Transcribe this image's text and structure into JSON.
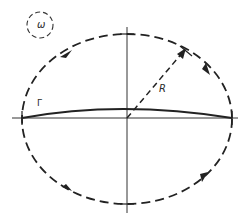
{
  "diagram": {
    "labels": {
      "omega": "ω",
      "radius": "R",
      "gamma": "Γ"
    },
    "colors": {
      "stroke": "#222222",
      "background": "#ffffff"
    },
    "elements": [
      {
        "type": "small-dashed-circle",
        "label": "ω"
      },
      {
        "type": "dashed-ellipse-contour",
        "direction": "clockwise",
        "arrows": 4
      },
      {
        "type": "horizontal-axis"
      },
      {
        "type": "vertical-axis"
      },
      {
        "type": "radius-dashed-arrow",
        "label": "R"
      },
      {
        "type": "arc-curve",
        "label": "Γ"
      }
    ]
  }
}
